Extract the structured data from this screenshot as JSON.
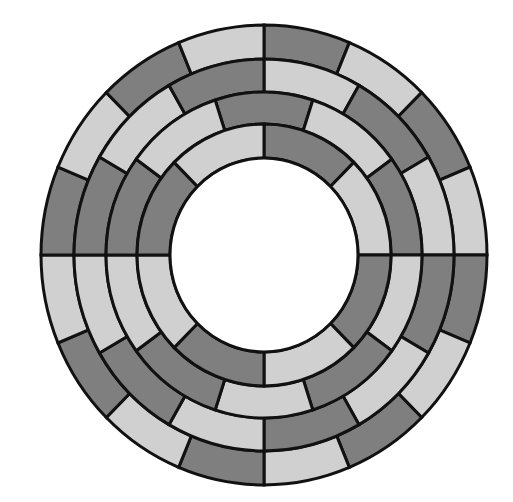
{
  "diagram": {
    "type": "concentric-segmented-rings",
    "center": {
      "x": 264,
      "y": 255
    },
    "y_scale": 1.031,
    "inner_hole_radius": 94,
    "colors": {
      "dark": "#7f7f7f",
      "light": "#d0d0d0",
      "stroke": "#111111",
      "hole": "#ffffff"
    },
    "rings": [
      {
        "name": "ring-1-inner",
        "r_inner": 94,
        "r_outer": 127,
        "segment_deg": 45,
        "start_deg": 0,
        "pattern": [
          "dark",
          "light",
          "dark",
          "light",
          "dark",
          "light",
          "dark",
          "light"
        ]
      },
      {
        "name": "ring-2",
        "r_inner": 127,
        "r_outer": 158,
        "segment_deg": 36,
        "start_deg": -18,
        "pattern": [
          "dark",
          "light",
          "dark",
          "light",
          "dark",
          "light",
          "dark",
          "light",
          "dark",
          "light"
        ]
      },
      {
        "name": "ring-3",
        "r_inner": 158,
        "r_outer": 190,
        "segment_deg": 30,
        "start_deg": 0,
        "pattern": [
          "light",
          "dark",
          "light",
          "dark",
          "light",
          "dark",
          "light",
          "dark",
          "light",
          "dark",
          "light",
          "dark"
        ]
      },
      {
        "name": "ring-4-outer",
        "r_inner": 190,
        "r_outer": 223,
        "segment_deg": 22.5,
        "start_deg": 0,
        "pattern": [
          "dark",
          "light",
          "dark",
          "light",
          "dark",
          "light",
          "dark",
          "light",
          "dark",
          "light",
          "dark",
          "light",
          "dark",
          "light",
          "dark",
          "light"
        ]
      }
    ]
  }
}
